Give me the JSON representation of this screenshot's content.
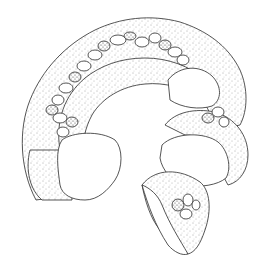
{
  "figure": {
    "background": "#ffffff",
    "ink": "#2a2a2a",
    "parts": [
      {
        "name": "main-coil",
        "description": "arched series of stippled chambers with braided central suture"
      },
      {
        "name": "left-end-chamber",
        "description": "large unshaded terminal chamber on left"
      },
      {
        "name": "right-end-chamber",
        "description": "large unshaded terminal chamber on right"
      },
      {
        "name": "fragment",
        "description": "small separate curved fragment at bottom center"
      }
    ]
  }
}
